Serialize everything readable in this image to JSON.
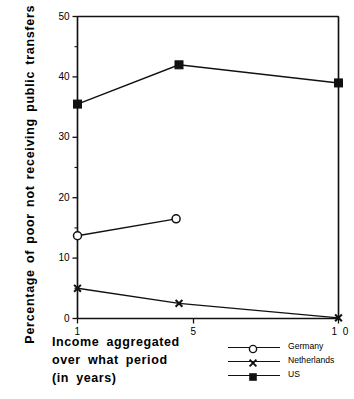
{
  "chart_data": {
    "type": "line",
    "title": "",
    "xlabel": "Income aggregated over what period (in years)",
    "ylabel": "Percentage of poor not receiving public transfers",
    "xlabel_lines": [
      "Income  aggregated",
      "over  what  period",
      "(in  years)"
    ],
    "xlim": [
      1,
      10
    ],
    "ylim": [
      0,
      50
    ],
    "yticks": [
      0,
      10,
      20,
      30,
      40,
      50
    ],
    "ytick_labels": [
      "0",
      "10",
      "20",
      "30",
      "40",
      "50"
    ],
    "yminor_ticks": [
      5,
      15,
      25,
      35,
      45
    ],
    "xticks": [
      1,
      5,
      10
    ],
    "xtick_labels": [
      "1",
      "5",
      "1 0"
    ],
    "grid": false,
    "legend_position": "bottom-right",
    "series": [
      {
        "name": "Germany",
        "marker": "open-circle",
        "color": "#111111",
        "points": [
          {
            "x": 1,
            "y": 13.7
          },
          {
            "x": 4.4,
            "y": 16.5
          }
        ]
      },
      {
        "name": "Netherlands",
        "marker": "x-cross",
        "color": "#111111",
        "points": [
          {
            "x": 1,
            "y": 5.0
          },
          {
            "x": 4.5,
            "y": 2.5
          },
          {
            "x": 10,
            "y": 0.1
          }
        ]
      },
      {
        "name": "US",
        "marker": "filled-square",
        "color": "#111111",
        "points": [
          {
            "x": 1,
            "y": 35.5
          },
          {
            "x": 4.5,
            "y": 42.0
          },
          {
            "x": 10,
            "y": 39.0
          }
        ]
      }
    ]
  },
  "legend": {
    "items": [
      {
        "label": "Germany",
        "marker": "open-circle"
      },
      {
        "label": "Netherlands",
        "marker": "x-cross"
      },
      {
        "label": "US",
        "marker": "filled-square"
      }
    ]
  }
}
